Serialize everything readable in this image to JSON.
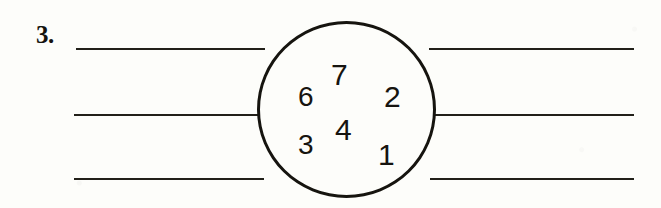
{
  "page": {
    "background_color": "#fdfdfa",
    "ink_color": "#16140f"
  },
  "item": {
    "number_label": "3."
  },
  "circle": {
    "label": "number-circle",
    "stroke_color": "#16140f"
  },
  "numbers": [
    {
      "id": "num-7",
      "value": "7"
    },
    {
      "id": "num-6",
      "value": "6"
    },
    {
      "id": "num-2",
      "value": "2"
    },
    {
      "id": "num-4",
      "value": "4"
    },
    {
      "id": "num-3",
      "value": "3"
    },
    {
      "id": "num-1",
      "value": "1"
    }
  ],
  "rules": {
    "count": 3,
    "segments": [
      "left",
      "right"
    ]
  }
}
